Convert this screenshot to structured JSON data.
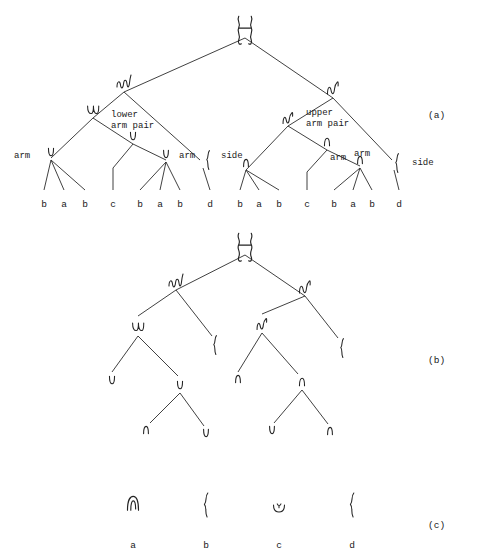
{
  "figure": {
    "width": 482,
    "height": 556,
    "background": "#ffffff",
    "ink_color": "#232323"
  },
  "panels": [
    {
      "id": "a",
      "tag": "(a)",
      "tag_x": 428,
      "tag_y": 110
    },
    {
      "id": "b",
      "tag": "(b)",
      "tag_x": 428,
      "tag_y": 355
    },
    {
      "id": "c",
      "tag": "(c)",
      "tag_x": 428,
      "tag_y": 520
    }
  ],
  "panel_a": {
    "annotations": [
      {
        "name": "arm-left-outer",
        "text": "arm",
        "x": 14,
        "y": 151
      },
      {
        "name": "lower-arm-pair",
        "text": "lower\narm pair",
        "x": 111,
        "y": 110
      },
      {
        "name": "arm-left-inner",
        "text": "arm",
        "x": 179,
        "y": 151
      },
      {
        "name": "side-left",
        "text": "side",
        "x": 221,
        "y": 151
      },
      {
        "name": "upper-arm-pair",
        "text": "upper\narm pair",
        "x": 306,
        "y": 108
      },
      {
        "name": "arm-right-inner",
        "text": "arm",
        "x": 330,
        "y": 153
      },
      {
        "name": "arm-right-outer",
        "text": "arm",
        "x": 354,
        "y": 149
      },
      {
        "name": "side-right",
        "text": "side",
        "x": 412,
        "y": 158
      }
    ],
    "leaves": [
      {
        "label": "b",
        "x": 44,
        "y": 199
      },
      {
        "label": "a",
        "x": 64,
        "y": 199
      },
      {
        "label": "b",
        "x": 85,
        "y": 199
      },
      {
        "label": "c",
        "x": 113,
        "y": 199
      },
      {
        "label": "b",
        "x": 140,
        "y": 199
      },
      {
        "label": "a",
        "x": 160,
        "y": 199
      },
      {
        "label": "b",
        "x": 180,
        "y": 199
      },
      {
        "label": "d",
        "x": 210,
        "y": 199
      },
      {
        "label": "b",
        "x": 240,
        "y": 199
      },
      {
        "label": "a",
        "x": 259,
        "y": 199
      },
      {
        "label": "b",
        "x": 279,
        "y": 199
      },
      {
        "label": "c",
        "x": 307,
        "y": 199
      },
      {
        "label": "b",
        "x": 334,
        "y": 199
      },
      {
        "label": "a",
        "x": 353,
        "y": 199
      },
      {
        "label": "b",
        "x": 372,
        "y": 199
      },
      {
        "label": "d",
        "x": 399,
        "y": 199
      }
    ],
    "nodes": [
      {
        "name": "root",
        "glyph": "double-loop",
        "x": 245,
        "y": 30,
        "size": 1.25
      },
      {
        "name": "left-child",
        "glyph": "triple-wave",
        "x": 124,
        "y": 82,
        "size": 1.0
      },
      {
        "name": "right-child",
        "glyph": "double-wave",
        "x": 333,
        "y": 88,
        "size": 1.0
      },
      {
        "name": "left-lowerarmpair",
        "glyph": "double-u",
        "x": 93,
        "y": 110,
        "size": 0.9
      },
      {
        "name": "left-armnode",
        "glyph": "single-u",
        "x": 133,
        "y": 136,
        "size": 0.85
      },
      {
        "name": "left-arm-outer",
        "glyph": "single-u",
        "x": 51,
        "y": 152,
        "size": 0.85
      },
      {
        "name": "left-arm-inner",
        "glyph": "single-u",
        "x": 166,
        "y": 154,
        "size": 0.8
      },
      {
        "name": "left-side-brace",
        "glyph": "brace",
        "x": 208,
        "y": 160,
        "size": 0.95
      },
      {
        "name": "right-upperarmpair",
        "glyph": "double-wave",
        "x": 288,
        "y": 118,
        "size": 0.9
      },
      {
        "name": "right-armnode",
        "glyph": "single-n",
        "x": 327,
        "y": 142,
        "size": 0.85
      },
      {
        "name": "right-arm-outer",
        "glyph": "single-n",
        "x": 246,
        "y": 163,
        "size": 0.8
      },
      {
        "name": "right-arm-inner",
        "glyph": "single-n",
        "x": 360,
        "y": 160,
        "size": 0.8
      },
      {
        "name": "right-side-brace",
        "glyph": "brace",
        "x": 397,
        "y": 163,
        "size": 0.95
      }
    ],
    "edges": [
      [
        245,
        38,
        124,
        92
      ],
      [
        245,
        38,
        333,
        98
      ],
      [
        124,
        92,
        93,
        118
      ],
      [
        124,
        92,
        200,
        160
      ],
      [
        93,
        118,
        51,
        158
      ],
      [
        93,
        118,
        133,
        144
      ],
      [
        133,
        144,
        113,
        168
      ],
      [
        133,
        144,
        166,
        160
      ],
      [
        51,
        160,
        44,
        190
      ],
      [
        51,
        160,
        64,
        190
      ],
      [
        51,
        160,
        85,
        190
      ],
      [
        113,
        168,
        113,
        190
      ],
      [
        166,
        162,
        140,
        190
      ],
      [
        166,
        162,
        160,
        190
      ],
      [
        166,
        162,
        180,
        190
      ],
      [
        203,
        168,
        210,
        190
      ],
      [
        333,
        98,
        288,
        126
      ],
      [
        333,
        98,
        392,
        160
      ],
      [
        288,
        126,
        246,
        170
      ],
      [
        288,
        126,
        327,
        150
      ],
      [
        327,
        150,
        307,
        172
      ],
      [
        327,
        150,
        360,
        166
      ],
      [
        246,
        170,
        240,
        190
      ],
      [
        246,
        170,
        259,
        190
      ],
      [
        246,
        170,
        279,
        190
      ],
      [
        307,
        172,
        307,
        190
      ],
      [
        360,
        168,
        334,
        190
      ],
      [
        360,
        168,
        353,
        190
      ],
      [
        360,
        168,
        372,
        190
      ],
      [
        394,
        170,
        399,
        190
      ]
    ]
  },
  "panel_b": {
    "nodes": [
      {
        "name": "root",
        "glyph": "double-loop",
        "x": 245,
        "y": 247,
        "size": 1.25
      },
      {
        "name": "left-child",
        "glyph": "triple-wave",
        "x": 176,
        "y": 281,
        "size": 1.0
      },
      {
        "name": "right-child",
        "glyph": "double-wave",
        "x": 305,
        "y": 287,
        "size": 1.0
      },
      {
        "name": "ll",
        "glyph": "double-u",
        "x": 138,
        "y": 327,
        "size": 0.9
      },
      {
        "name": "lr-brace",
        "glyph": "brace",
        "x": 215,
        "y": 345,
        "size": 0.95
      },
      {
        "name": "lll",
        "glyph": "single-u",
        "x": 112,
        "y": 380,
        "size": 0.85
      },
      {
        "name": "llr",
        "glyph": "single-u",
        "x": 180,
        "y": 385,
        "size": 0.85
      },
      {
        "name": "llrl",
        "glyph": "single-n",
        "x": 146,
        "y": 430,
        "size": 0.8
      },
      {
        "name": "llrr",
        "glyph": "single-u",
        "x": 206,
        "y": 433,
        "size": 0.8
      },
      {
        "name": "rl",
        "glyph": "double-wave",
        "x": 262,
        "y": 324,
        "size": 0.9
      },
      {
        "name": "rr-brace",
        "glyph": "brace",
        "x": 342,
        "y": 348,
        "size": 0.95
      },
      {
        "name": "rll",
        "glyph": "single-n",
        "x": 238,
        "y": 379,
        "size": 0.8
      },
      {
        "name": "rlr",
        "glyph": "single-n",
        "x": 302,
        "y": 382,
        "size": 0.85
      },
      {
        "name": "rlrl",
        "glyph": "single-u",
        "x": 272,
        "y": 430,
        "size": 0.8
      },
      {
        "name": "rlrr",
        "glyph": "single-n",
        "x": 330,
        "y": 431,
        "size": 0.8
      }
    ],
    "edges": [
      [
        245,
        255,
        176,
        290
      ],
      [
        245,
        255,
        305,
        296
      ],
      [
        176,
        290,
        138,
        316
      ],
      [
        176,
        290,
        212,
        336
      ],
      [
        305,
        296,
        262,
        314
      ],
      [
        305,
        296,
        338,
        338
      ],
      [
        138,
        336,
        112,
        372
      ],
      [
        138,
        336,
        178,
        376
      ],
      [
        180,
        393,
        150,
        423
      ],
      [
        180,
        393,
        204,
        426
      ],
      [
        262,
        333,
        238,
        372
      ],
      [
        262,
        333,
        298,
        374
      ],
      [
        302,
        390,
        274,
        423
      ],
      [
        302,
        390,
        328,
        424
      ]
    ]
  },
  "panel_c": {
    "symbols": [
      {
        "label": "a",
        "glyph": "arch-n",
        "x": 133,
        "y": 503,
        "size": 1.1
      },
      {
        "label": "b",
        "glyph": "brace",
        "x": 206,
        "y": 505,
        "size": 1.2
      },
      {
        "label": "c",
        "glyph": "cup-dot",
        "x": 279,
        "y": 507,
        "size": 1.0
      },
      {
        "label": "d",
        "glyph": "brace",
        "x": 352,
        "y": 505,
        "size": 1.2
      }
    ],
    "leaf_labels": [
      {
        "label": "a",
        "x": 133,
        "y": 540
      },
      {
        "label": "b",
        "x": 206,
        "y": 540
      },
      {
        "label": "c",
        "x": 279,
        "y": 540
      },
      {
        "label": "d",
        "x": 352,
        "y": 540
      }
    ]
  }
}
